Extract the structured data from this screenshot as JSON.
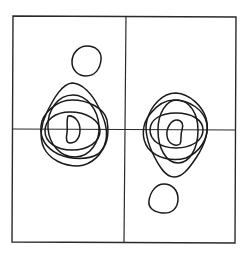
{
  "figure": {
    "type": "contour-diagram",
    "colors": {
      "background": "#ffffff",
      "line": "#1a1a1a"
    },
    "frame": {
      "x0": 13,
      "y0": 16,
      "x1": 236,
      "y1": 242
    },
    "dividers": {
      "vertical": {
        "x_top": 126,
        "x_bottom": 124
      },
      "horizontal": {
        "y_left": 129,
        "y_right": 129
      }
    },
    "clusters": [
      {
        "name": "left-cluster",
        "center": [
          73,
          129
        ],
        "contours": [
          {
            "name": "outer-tall",
            "bbox": [
              40,
              83,
              108,
              166
            ]
          },
          {
            "name": "wide",
            "bbox": [
              40,
              100,
              108,
              158
            ]
          },
          {
            "name": "medium-oval",
            "bbox": [
              48,
              95,
              100,
              157
            ]
          },
          {
            "name": "flat-ellipse",
            "bbox": [
              45,
              112,
              100,
              150
            ]
          },
          {
            "name": "inner-d",
            "bbox": [
              66,
              115,
              80,
              143
            ]
          }
        ]
      },
      {
        "name": "right-cluster",
        "center": [
          175,
          129
        ],
        "contours": [
          {
            "name": "outer-tall",
            "bbox": [
              145,
              93,
              208,
              177
            ]
          },
          {
            "name": "wide",
            "bbox": [
              142,
              100,
              208,
              160
            ]
          },
          {
            "name": "medium-oval",
            "bbox": [
              158,
              100,
              198,
              163
            ]
          },
          {
            "name": "flat-ellipse",
            "bbox": [
              150,
              113,
              203,
              148
            ]
          },
          {
            "name": "inner-bean",
            "bbox": [
              167,
              120,
              183,
              145
            ]
          }
        ]
      }
    ],
    "isolated_contours": [
      {
        "name": "top-left-circle",
        "center": [
          87,
          61
        ],
        "radius": 15
      },
      {
        "name": "bottom-right-circle",
        "center": [
          163,
          199
        ],
        "radius": 15
      }
    ]
  }
}
